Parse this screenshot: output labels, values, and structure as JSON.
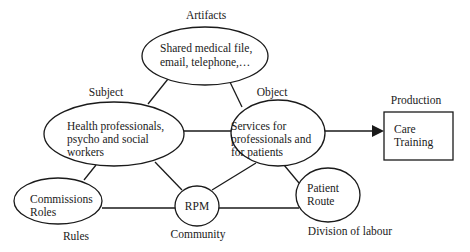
{
  "diagram": {
    "type": "activity-theory-triangle",
    "labels": {
      "artifacts": "Artifacts",
      "subject": "Subject",
      "object": "Object",
      "production": "Production",
      "rules": "Rules",
      "community": "Community",
      "division": "Division of labour"
    },
    "nodes": {
      "artifacts": {
        "lines": [
          "Shared medical file,",
          "email, telephone,…"
        ]
      },
      "subject": {
        "lines": [
          "Health professionals,",
          "psycho and social",
          "workers"
        ]
      },
      "object": {
        "lines": [
          "Services for",
          "professionals and",
          "for patients"
        ]
      },
      "production": {
        "lines": [
          "Care",
          "Training"
        ]
      },
      "rules": {
        "lines": [
          "Commissions",
          "Roles"
        ]
      },
      "community": {
        "lines": [
          "RPM"
        ]
      },
      "division": {
        "lines": [
          "Patient",
          "Route"
        ]
      }
    },
    "colors": {
      "stroke": "#1a1a1a",
      "background": "#ffffff"
    }
  }
}
